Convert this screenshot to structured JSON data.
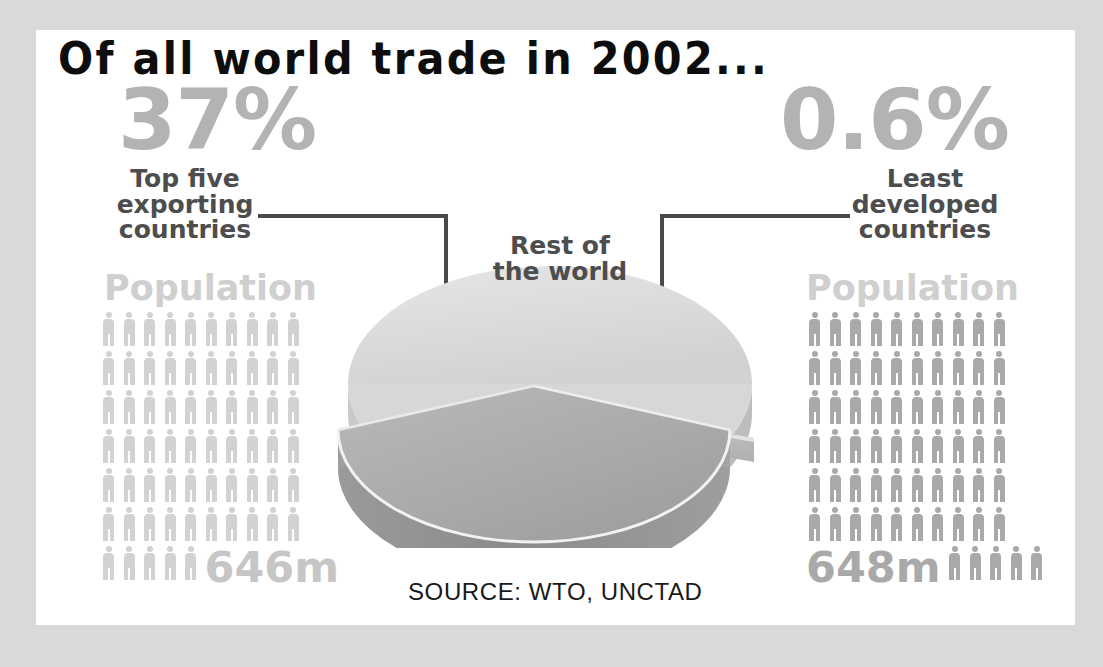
{
  "title": "Of all world trade in 2002...",
  "source": "SOURCE: WTO, UNCTAD",
  "center_label_line1": "Rest of",
  "center_label_line2": "the world",
  "left": {
    "percent": "37%",
    "caption_line1": "Top five",
    "caption_line2": "exporting",
    "caption_line3": "countries",
    "population_label": "Population",
    "population_value": "646m"
  },
  "right": {
    "percent": "0.6%",
    "caption_line1": "Least",
    "caption_line2": "developed",
    "caption_line3": "countries",
    "population_label": "Population",
    "population_value": "648m"
  },
  "colors": {
    "page_background": "#d9d9d9",
    "card_background": "#ffffff",
    "title_text": "#0d0d0d",
    "big_percent": "#b3b3b3",
    "caption_text": "#4d4d4d",
    "population_label": "#cfcfcf",
    "figures_left": "#d2d2d2",
    "figures_right": "#a9a9a9",
    "leader_line": "#4a4a4a",
    "pie_top_rest": "#dcdcdc",
    "pie_top_front": "#ababab",
    "pie_side_front": "#8f8f8f"
  },
  "chart_data": {
    "type": "pie",
    "title": "Of all world trade in 2002...",
    "categories": [
      "Top five exporting countries",
      "Rest of the world",
      "Least developed countries"
    ],
    "values": [
      37,
      62.4,
      0.6
    ],
    "value_labels": [
      "37%",
      "",
      "0.6%"
    ],
    "unit": "percent of world trade",
    "exploded": [
      "Top five exporting countries",
      "Least developed countries"
    ],
    "legend": "none",
    "annotations": [
      "Rest of the world",
      "Top five exporting countries: 37%",
      "Least developed countries: 0.6%"
    ],
    "source": "SOURCE: WTO, UNCTAD"
  },
  "pictograms": {
    "left": {
      "label": "Population",
      "total_label": "646m",
      "rows": [
        10,
        10,
        10,
        10,
        10,
        10
      ],
      "last_row_count": 5,
      "last_row_position": "before-number"
    },
    "right": {
      "label": "Population",
      "total_label": "648m",
      "rows": [
        10,
        10,
        10,
        10,
        10,
        10
      ],
      "last_row_count": 5,
      "last_row_position": "after-number"
    }
  }
}
